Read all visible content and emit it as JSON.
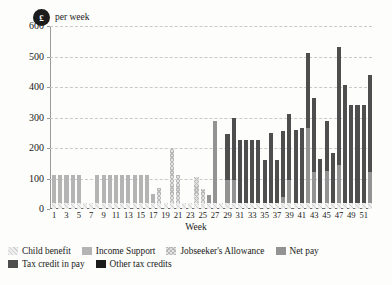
{
  "unit_badge": "£",
  "unit_text": "per week",
  "chart_data": {
    "type": "bar",
    "stacked": true,
    "title": "",
    "subtitle": "",
    "xlabel": "Week",
    "ylabel": "£ per week",
    "ylim": [
      0,
      600
    ],
    "yticks": [
      0,
      100,
      200,
      300,
      400,
      500,
      600
    ],
    "grid": true,
    "legend_position": "bottom",
    "x": [
      1,
      2,
      3,
      4,
      5,
      6,
      7,
      8,
      9,
      10,
      11,
      12,
      13,
      14,
      15,
      16,
      17,
      18,
      19,
      20,
      21,
      22,
      23,
      24,
      25,
      26,
      27,
      28,
      29,
      30,
      31,
      32,
      33,
      34,
      35,
      36,
      37,
      38,
      39,
      40,
      41,
      42,
      43,
      44,
      45,
      46,
      47,
      48,
      49,
      50,
      51,
      52
    ],
    "categories": [
      "1",
      "2",
      "3",
      "4",
      "5",
      "6",
      "7",
      "8",
      "9",
      "10",
      "11",
      "12",
      "13",
      "14",
      "15",
      "16",
      "17",
      "18",
      "19",
      "20",
      "21",
      "22",
      "23",
      "24",
      "25",
      "26",
      "27",
      "28",
      "29",
      "30",
      "31",
      "32",
      "33",
      "34",
      "35",
      "36",
      "37",
      "38",
      "39",
      "40",
      "41",
      "42",
      "43",
      "44",
      "45",
      "46",
      "47",
      "48",
      "49",
      "50",
      "51",
      "52"
    ],
    "xtick_labels": [
      "1",
      "3",
      "5",
      "7",
      "9",
      "11",
      "13",
      "15",
      "17",
      "19",
      "21",
      "23",
      "25",
      "27",
      "29",
      "31",
      "33",
      "35",
      "37",
      "39",
      "41",
      "43",
      "45",
      "47",
      "49",
      "51"
    ],
    "series": [
      {
        "name": "Child benefit",
        "color": "#efefef",
        "pattern": "diagonal-hatch-light",
        "values": [
          20,
          20,
          20,
          20,
          20,
          20,
          20,
          20,
          20,
          20,
          20,
          20,
          20,
          20,
          20,
          20,
          20,
          20,
          20,
          20,
          20,
          20,
          20,
          20,
          20,
          20,
          20,
          20,
          20,
          20,
          20,
          20,
          20,
          20,
          20,
          20,
          20,
          20,
          20,
          20,
          20,
          20,
          20,
          20,
          20,
          20,
          20,
          20,
          20,
          20,
          20,
          20
        ]
      },
      {
        "name": "Income Support",
        "color": "#b4b4b4",
        "pattern": "solid",
        "values": [
          90,
          90,
          90,
          90,
          90,
          0,
          0,
          90,
          90,
          90,
          90,
          90,
          90,
          90,
          90,
          90,
          30,
          0,
          0,
          0,
          0,
          0,
          0,
          0,
          0,
          0,
          0,
          0,
          0,
          0,
          0,
          0,
          0,
          0,
          0,
          0,
          0,
          0,
          0,
          0,
          0,
          0,
          0,
          0,
          0,
          0,
          0,
          0,
          0,
          0,
          0,
          0
        ]
      },
      {
        "name": "Jobseeker's Allowance",
        "color": "#e2e2e2",
        "pattern": "cross-hatch-light",
        "values": [
          0,
          0,
          0,
          0,
          0,
          0,
          0,
          0,
          0,
          0,
          0,
          0,
          0,
          0,
          0,
          0,
          0,
          50,
          0,
          180,
          90,
          0,
          0,
          85,
          45,
          0,
          0,
          0,
          0,
          0,
          0,
          0,
          0,
          0,
          0,
          0,
          0,
          0,
          0,
          0,
          0,
          0,
          0,
          0,
          0,
          0,
          0,
          0,
          0,
          0,
          0,
          0
        ]
      },
      {
        "name": "Net pay",
        "color": "#939393",
        "pattern": "solid",
        "values": [
          0,
          0,
          0,
          0,
          0,
          0,
          0,
          0,
          0,
          0,
          0,
          0,
          0,
          0,
          0,
          0,
          0,
          0,
          0,
          0,
          0,
          0,
          0,
          0,
          0,
          25,
          270,
          0,
          75,
          75,
          0,
          0,
          0,
          0,
          0,
          0,
          0,
          20,
          75,
          0,
          0,
          245,
          100,
          0,
          105,
          0,
          125,
          0,
          0,
          0,
          0,
          100
        ]
      },
      {
        "name": "Tax credit in pay",
        "color": "#4e4e4e",
        "pattern": "solid",
        "values": [
          0,
          0,
          0,
          0,
          0,
          0,
          0,
          0,
          0,
          0,
          0,
          0,
          0,
          0,
          0,
          0,
          0,
          0,
          0,
          0,
          0,
          0,
          0,
          0,
          0,
          0,
          0,
          0,
          150,
          205,
          205,
          205,
          205,
          205,
          140,
          230,
          140,
          215,
          215,
          240,
          245,
          245,
          245,
          145,
          165,
          165,
          385,
          385,
          320,
          320,
          320,
          320
        ]
      },
      {
        "name": "Other tax credits",
        "color": "#1b1b1b",
        "pattern": "solid",
        "values": [
          0,
          0,
          0,
          0,
          0,
          0,
          0,
          0,
          0,
          0,
          0,
          0,
          0,
          0,
          0,
          0,
          0,
          0,
          0,
          0,
          0,
          0,
          0,
          0,
          0,
          0,
          0,
          0,
          0,
          0,
          0,
          0,
          0,
          0,
          0,
          0,
          0,
          0,
          0,
          0,
          0,
          0,
          0,
          0,
          0,
          0,
          0,
          0,
          0,
          0,
          0,
          0
        ]
      }
    ],
    "totals": [
      110,
      110,
      110,
      110,
      110,
      20,
      20,
      110,
      110,
      110,
      110,
      110,
      110,
      110,
      110,
      110,
      50,
      70,
      20,
      200,
      110,
      20,
      105,
      105,
      65,
      45,
      290,
      20,
      245,
      300,
      225,
      225,
      225,
      225,
      160,
      250,
      160,
      255,
      310,
      260,
      265,
      510,
      365,
      165,
      290,
      185,
      410,
      20,
      560,
      20,
      445,
      20
    ],
    "annotations": []
  },
  "legend": {
    "items": [
      {
        "label": "Child benefit",
        "swatch_class": "s-cb"
      },
      {
        "label": "Income Support",
        "swatch_class": "s-is"
      },
      {
        "label": "Jobseeker's Allowance",
        "swatch_class": "s-jsa"
      },
      {
        "label": "Net pay",
        "swatch_class": "s-np"
      },
      {
        "label": "Tax credit in pay",
        "swatch_class": "s-tc"
      },
      {
        "label": "Other tax credits",
        "swatch_class": "s-ot"
      }
    ]
  }
}
